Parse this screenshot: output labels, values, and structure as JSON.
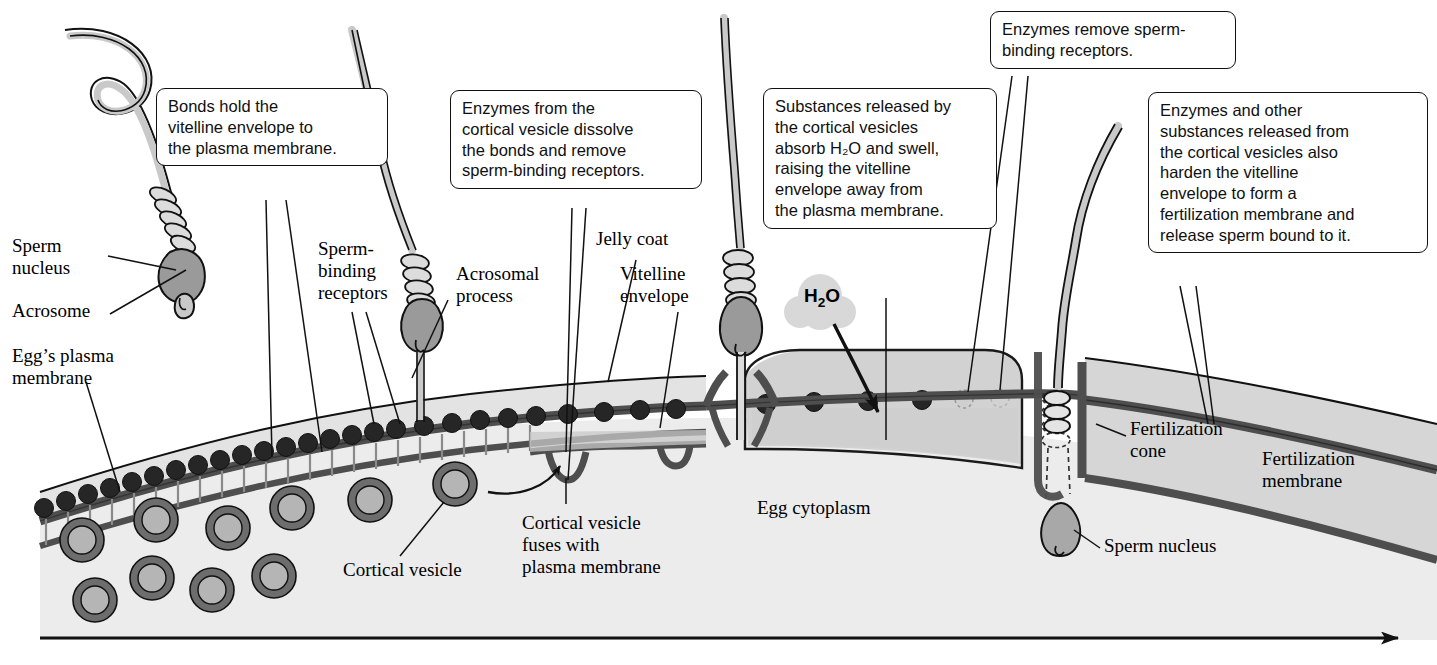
{
  "figure": {
    "time_arrow": "time-arrow"
  },
  "colors": {
    "jelly_coat": "#e3e3e3",
    "cytoplasm": "#ececec",
    "membrane_dark": "#5a5a5a",
    "membrane_line": "#1a1a1a",
    "receptor": "#2a2a2a",
    "vesicle_outer": "#6d6d6d",
    "vesicle_inner": "#b5b5b5",
    "sperm_fill": "#c9c9c9",
    "nucleus_fill": "#9a9a9a",
    "perivitelline": "#d2d2d2",
    "outline": "#111111",
    "h2o_cloud": "#d8d8d8"
  },
  "callouts": [
    {
      "id": "bonds-hold",
      "text": "Bonds hold the\nvitelline envelope to\nthe plasma membrane."
    },
    {
      "id": "enzymes-dissolve",
      "text": "Enzymes from the\ncortical vesicle dissolve\nthe bonds and remove\nsperm-binding receptors."
    },
    {
      "id": "substances-absorb-water",
      "text": "Substances released by\nthe cortical vesicles\nabsorb H₂O and swell,\nraising the vitelline\nenvelope away from\nthe plasma membrane."
    },
    {
      "id": "enzymes-remove-receptors",
      "text": "Enzymes remove sperm-\nbinding receptors."
    },
    {
      "id": "enzymes-harden-envelope",
      "text": "Enzymes and other\nsubstances released from\nthe cortical vesicles also\nharden the vitelline\nenvelope to form a\nfertilization membrane and\nrelease sperm bound to it."
    }
  ],
  "labels": [
    {
      "id": "sperm-nucleus-left",
      "text": "Sperm\nnucleus"
    },
    {
      "id": "acrosome",
      "text": "Acrosome"
    },
    {
      "id": "eggs-plasma-membrane",
      "text": "Egg’s plasma\nmembrane"
    },
    {
      "id": "sperm-binding-receptors",
      "text": "Sperm-\nbinding\nreceptors"
    },
    {
      "id": "acrosomal-process",
      "text": "Acrosomal\nprocess"
    },
    {
      "id": "jelly-coat",
      "text": "Jelly coat"
    },
    {
      "id": "vitelline-envelope",
      "text": "Vitelline\nenvelope"
    },
    {
      "id": "cortical-vesicle",
      "text": "Cortical vesicle"
    },
    {
      "id": "cortical-vesicle-fuses",
      "text": "Cortical vesicle\nfuses with\nplasma membrane"
    },
    {
      "id": "egg-cytoplasm",
      "text": "Egg cytoplasm"
    },
    {
      "id": "fertilization-cone",
      "text": "Fertilization\ncone"
    },
    {
      "id": "fertilization-membrane",
      "text": "Fertilization\nmembrane"
    },
    {
      "id": "sperm-nucleus-right",
      "text": "Sperm nucleus"
    }
  ],
  "molecule": {
    "formula_main": "H",
    "formula_sub": "2",
    "formula_tail": "O"
  },
  "structures": {
    "sperm_count": 4,
    "cortical_vesicle_count": 10,
    "receptor_count_intact": 30,
    "receptor_count_fading": 2
  }
}
